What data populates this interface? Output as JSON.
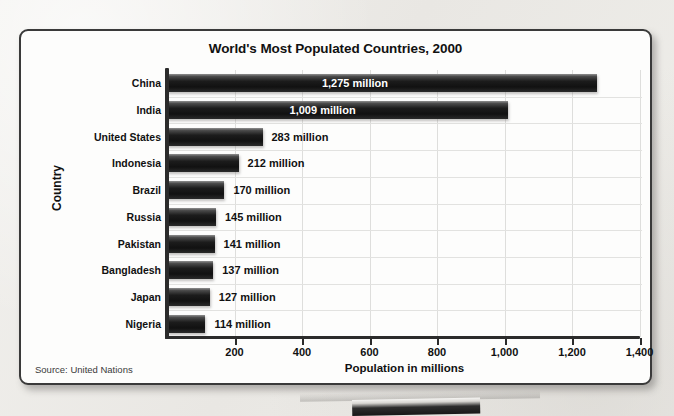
{
  "background": {
    "outer_color": "#eceae7",
    "card_color": "#fdfdfc",
    "border_color": "#3a3a3a",
    "bar_color": "#1c1c1c",
    "grid_color": "#dededc"
  },
  "chart_data": {
    "type": "bar",
    "orientation": "horizontal",
    "title": "World's Most Populated Countries, 2000",
    "xlabel": "Population in millions",
    "ylabel": "Country",
    "xlim": [
      0,
      1400
    ],
    "xticks": [
      200,
      400,
      600,
      800,
      1000,
      1200,
      1400
    ],
    "xtick_labels": [
      "200",
      "400",
      "600",
      "800",
      "1,000",
      "1,200",
      "1,400"
    ],
    "grid": true,
    "legend": null,
    "categories": [
      "China",
      "India",
      "United States",
      "Indonesia",
      "Brazil",
      "Russia",
      "Pakistan",
      "Bangladesh",
      "Japan",
      "Nigeria"
    ],
    "values": [
      1275,
      1009,
      283,
      212,
      170,
      145,
      141,
      137,
      127,
      114
    ],
    "data_labels": [
      "1,275 million",
      "1,009 million",
      "283 million",
      "212 million",
      "170 million",
      "145 million",
      "141 million",
      "137 million",
      "127 million",
      "114 million"
    ],
    "label_placement": [
      "inside",
      "inside",
      "outside",
      "outside",
      "outside",
      "outside",
      "outside",
      "outside",
      "outside",
      "outside"
    ],
    "source": "Source: United Nations"
  }
}
